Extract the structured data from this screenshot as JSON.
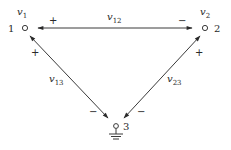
{
  "diagram": {
    "title": "",
    "nodes": [
      {
        "id": "1",
        "label": "1",
        "potential": "v",
        "potential_sub": "1"
      },
      {
        "id": "2",
        "label": "2",
        "potential": "v",
        "potential_sub": "2"
      },
      {
        "id": "3",
        "label": "3",
        "potential": "",
        "potential_sub": "",
        "grounded": true
      }
    ],
    "branches": [
      {
        "from": "1",
        "to": "2",
        "voltage": "v",
        "voltage_sub": "12",
        "plus": "+",
        "minus": "−"
      },
      {
        "from": "1",
        "to": "3",
        "voltage": "v",
        "voltage_sub": "13",
        "plus": "+",
        "minus": "−"
      },
      {
        "from": "2",
        "to": "3",
        "voltage": "v",
        "voltage_sub": "23",
        "plus": "+",
        "minus": "−"
      }
    ],
    "colors": {
      "ink": "#2a2a2a",
      "background": "#ffffff"
    }
  }
}
